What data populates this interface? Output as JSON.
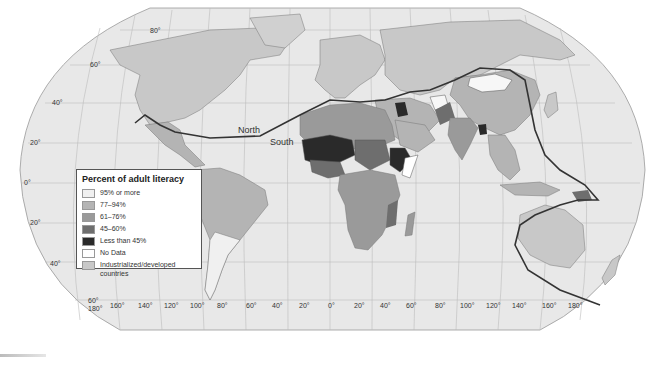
{
  "map": {
    "ocean_color": "#e8e8e8",
    "developed_color": "#c8c8c8",
    "divide_line_color": "#333333",
    "divide_labels": {
      "north": "North",
      "south": "South"
    },
    "latitude_labels": [
      "80°",
      "60°",
      "40°",
      "20°",
      "0°",
      "20°",
      "40°",
      "60°"
    ],
    "longitude_labels": [
      "180°",
      "160°",
      "140°",
      "120°",
      "100°",
      "80°",
      "60°",
      "40°",
      "20°",
      "0°",
      "20°",
      "40°",
      "60°",
      "80°",
      "100°",
      "120°",
      "140°",
      "160°",
      "180°"
    ]
  },
  "legend": {
    "title": "Percent of adult literacy",
    "items": [
      {
        "label": "95% or more",
        "color": "#f0f0f0"
      },
      {
        "label": "77–94%",
        "color": "#b4b4b4"
      },
      {
        "label": "61–76%",
        "color": "#9a9a9a"
      },
      {
        "label": "45–60%",
        "color": "#6e6e6e"
      },
      {
        "label": "Less than 45%",
        "color": "#2a2a2a"
      },
      {
        "label": "No Data",
        "color": "#ffffff"
      },
      {
        "label": "Industrialized/developed countries",
        "color": "#c8c8c8"
      }
    ]
  }
}
